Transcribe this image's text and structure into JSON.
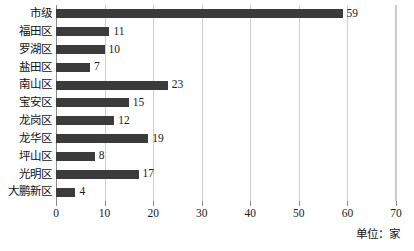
{
  "chart_data": {
    "type": "bar",
    "orientation": "horizontal",
    "title": "",
    "subtitle": "",
    "xlabel": "",
    "ylabel": "",
    "unit_note": "单位：家",
    "categories": [
      "市级",
      "福田区",
      "罗湖区",
      "盐田区",
      "南山区",
      "宝安区",
      "龙岗区",
      "龙华区",
      "坪山区",
      "光明区",
      "大鹏新区"
    ],
    "values": [
      59,
      11,
      10,
      7,
      23,
      15,
      12,
      19,
      8,
      17,
      4
    ],
    "value_labels": [
      "59",
      "11",
      "10",
      "7",
      "23",
      "15",
      "12",
      "19",
      "8",
      "17",
      "4"
    ],
    "xlim": [
      0,
      70
    ],
    "xticks": [
      0,
      10,
      20,
      30,
      40,
      50,
      60,
      70
    ],
    "xtick_labels": [
      "0",
      "10",
      "20",
      "30",
      "40",
      "50",
      "60",
      "70"
    ],
    "grid": "vertical",
    "legend": "none",
    "bar_color": "#3b3b3b",
    "gridline_color": "#cfcfcf",
    "axis_color": "#8a8a8a",
    "background": "#ffffff"
  }
}
